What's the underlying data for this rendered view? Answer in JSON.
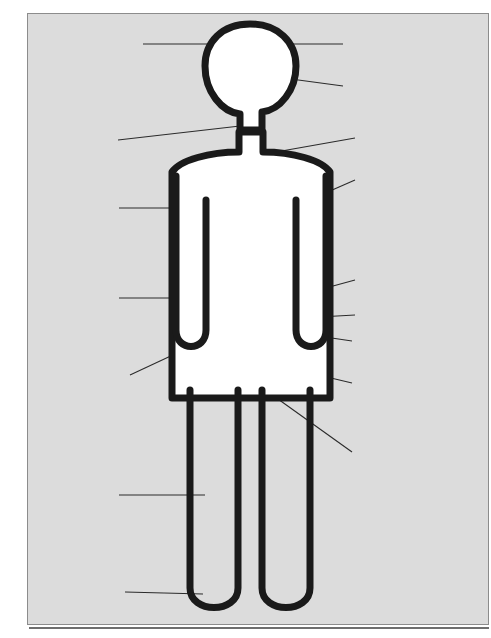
{
  "diagram": {
    "type": "annotated human body diagram",
    "figure_name": "human-body-outline",
    "colors": {
      "background": "#ffffff",
      "panel": "#dcdcdc",
      "body_stroke": "#1a1a1a",
      "body_fill": "#ffffff",
      "marker": "#141414",
      "leader_line": "#2b2b2b",
      "box_border": "#3a3a3a",
      "box_fill": "#ffffff",
      "text": "#0d0d0d"
    }
  },
  "callouts": {
    "left": [
      {
        "id": "brain-behaviour",
        "name": "callout-brain-behaviour",
        "side": "left",
        "lines": [
          "Aggressive, Irrational behaviour.",
          "Arguments. Violence. Depression.",
          "Nervousness. Chronic anxiety.",
          "Unknown fears. Hallucinations.",
          "Serious psychiatric disorders.",
          "Epilepsy. Dementia (wet brain)."
        ],
        "target": "head-upper"
      },
      {
        "id": "throat",
        "name": "callout-throat",
        "side": "left",
        "lines": [
          "Chronic coughing.",
          "Throat cancer.",
          "(Cancer of the Larynx)"
        ],
        "target": "neck"
      },
      {
        "id": "lungs",
        "name": "callout-lungs",
        "side": "left",
        "lines": [
          "Frequent colds.",
          "Reduced resistance to",
          "infection. Increased",
          "risk of pneumonia &",
          "tuberculosis."
        ],
        "target": "chest-left"
      },
      {
        "id": "liver",
        "name": "callout-liver",
        "side": "left",
        "lines": [
          "Liver damage leading",
          "to Cirrhosis (hardening",
          "of the liver) and",
          "alcoholic hepatitis."
        ],
        "target": "abdomen-left"
      },
      {
        "id": "hands",
        "name": "callout-hands",
        "side": "left",
        "lines": [
          "Trembling hands.",
          "Tingling fingers.",
          "Numbness, loss of",
          "sensation in the fingers.",
          "Peripheral neuritis."
        ],
        "target": "hand-left"
      },
      {
        "id": "legs",
        "name": "callout-legs",
        "side": "left",
        "lines": [
          "Impaired sensation",
          "leading to falls and",
          "numbness causing",
          "skin damage."
        ],
        "target": "leg-left"
      },
      {
        "id": "toes",
        "name": "callout-toes",
        "side": "left",
        "lines": [
          "Numb, tingling toes.",
          "Peripheral neuritis."
        ],
        "target": "foot-left"
      }
    ],
    "right": [
      {
        "id": "memory",
        "name": "callout-memory",
        "side": "right",
        "lines": [
          "Blackouts (alcohol amnesia)",
          "Serious memory loss.",
          "Damage to nerves,",
          "slowing of responses."
        ],
        "target": "head-upper"
      },
      {
        "id": "face",
        "name": "callout-face",
        "side": "right",
        "lines": [
          "Facial deterioration.",
          "Puffy eyes. 'Drinkers'",
          "Nose'. Looking older."
        ],
        "target": "face"
      },
      {
        "id": "oesophagus",
        "name": "callout-oesophagus",
        "side": "right",
        "lines": [
          "Cancer of the Oesophagus"
        ],
        "target": "throat-lower"
      },
      {
        "id": "heart",
        "name": "callout-heart",
        "side": "right",
        "lines": [
          "Weakness of heart muscle.",
          "Heart failure. Anaemia,",
          "impaired blood clotting."
        ],
        "target": "chest-right"
      },
      {
        "id": "stomach",
        "name": "callout-stomach",
        "side": "right",
        "lines": [
          "Vitamin deficiency.",
          "Haemorrhage.",
          "Severe inflammation of the",
          "stomach.",
          "Vomiting, Diarrhoea.",
          "Obesity."
        ],
        "target": "stomach"
      },
      {
        "id": "pancreas",
        "name": "callout-pancreas",
        "side": "right",
        "lines": [
          "Inflammation of the pancreas"
        ],
        "target": "pancreas"
      },
      {
        "id": "duodenum",
        "name": "callout-duodenum",
        "side": "right",
        "lines": [
          "Duodenal Ulcer."
        ],
        "target": "duodenum"
      },
      {
        "id": "kidney",
        "name": "callout-kidney",
        "side": "right",
        "lines": [
          "Impaired kidney function.",
          "Urinary infections."
        ],
        "target": "kidney"
      },
      {
        "id": "reproductive",
        "name": "callout-reproductive",
        "side": "right",
        "lines": [
          "In men: Impaired sexual",
          "performance, impotence.",
          "In women: Unwanted",
          "pregnancies, risk of giving",
          "birth to deformed, retarded",
          "babies, or low birth weight",
          "babies."
        ],
        "target": "pelvis"
      }
    ]
  },
  "markers": [
    {
      "id": "head-upper",
      "name": "marker-head-upper",
      "cx": 250,
      "cy": 44,
      "r": 11
    },
    {
      "id": "face",
      "name": "marker-face",
      "cx": 265,
      "cy": 74,
      "r": 11.5
    },
    {
      "id": "neck",
      "name": "marker-neck",
      "cx": 250,
      "cy": 124,
      "r": 11
    },
    {
      "id": "throat-lower",
      "name": "marker-throat-lower",
      "cx": 249,
      "cy": 157,
      "r": 11.5
    },
    {
      "id": "chest-left",
      "name": "marker-chest-left",
      "cx": 228,
      "cy": 208,
      "r": 11
    },
    {
      "id": "chest-right",
      "name": "marker-chest-right",
      "cx": 270,
      "cy": 216,
      "r": 12
    },
    {
      "id": "stomach",
      "name": "marker-stomach",
      "cx": 289,
      "cy": 296,
      "r": 11
    },
    {
      "id": "pancreas",
      "name": "marker-pancreas",
      "cx": 290,
      "cy": 318,
      "r": 11
    },
    {
      "id": "abdomen-left",
      "name": "marker-abdomen-left",
      "cx": 213,
      "cy": 298,
      "r": 11.5
    },
    {
      "id": "duodenum",
      "name": "marker-duodenum",
      "cx": 246,
      "cy": 325,
      "r": 10.5
    },
    {
      "id": "kidney",
      "name": "marker-kidney",
      "cx": 244,
      "cy": 357,
      "r": 11
    },
    {
      "id": "pelvis",
      "name": "marker-pelvis",
      "cx": 246,
      "cy": 380,
      "r": 12
    },
    {
      "id": "hand-left",
      "name": "marker-hand-left",
      "cx": 182,
      "cy": 340,
      "r": 11.5
    },
    {
      "id": "leg-left",
      "name": "marker-leg-left",
      "cx": 215,
      "cy": 495,
      "r": 11
    },
    {
      "id": "foot-left",
      "name": "marker-foot-left",
      "cx": 213,
      "cy": 594,
      "r": 11
    }
  ]
}
